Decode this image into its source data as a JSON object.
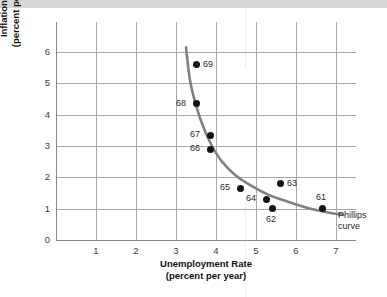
{
  "chart_data": {
    "type": "scatter",
    "title": "",
    "xlabel": "Unemployment Rate (percent per year)",
    "xlabel_line1": "Unemployment Rate",
    "xlabel_line2": "(percent per year)",
    "ylabel": "Inflation Rate (percent per year)",
    "ylabel_line1": "Inflation Rate",
    "ylabel_line2": "(percent per year)",
    "xlim": [
      0,
      7.5
    ],
    "ylim": [
      0,
      6.4
    ],
    "xticks": [
      "1",
      "2",
      "3",
      "4",
      "5",
      "6",
      "7"
    ],
    "yticks": [
      "0",
      "1",
      "2",
      "3",
      "4",
      "5",
      "6"
    ],
    "grid": "both",
    "legend": "none",
    "annotations": [
      {
        "name": "phillips-curve-label",
        "line1": "Phillips",
        "line2": "curve",
        "x": 7.05,
        "y": 0.78
      }
    ],
    "points": [
      {
        "label": "69",
        "x": 3.5,
        "y": 5.6,
        "label_pos": "right"
      },
      {
        "label": "68",
        "x": 3.5,
        "y": 4.35,
        "label_pos": "left"
      },
      {
        "label": "67",
        "x": 3.85,
        "y": 3.35,
        "label_pos": "left"
      },
      {
        "label": "66",
        "x": 3.85,
        "y": 2.9,
        "label_pos": "left"
      },
      {
        "label": "65",
        "x": 4.6,
        "y": 1.65,
        "label_pos": "left"
      },
      {
        "label": "64",
        "x": 5.25,
        "y": 1.3,
        "label_pos": "left"
      },
      {
        "label": "63",
        "x": 5.6,
        "y": 1.8,
        "label_pos": "right"
      },
      {
        "label": "62",
        "x": 5.4,
        "y": 1.0,
        "label_pos": "below"
      },
      {
        "label": "61",
        "x": 6.65,
        "y": 1.0,
        "label_pos": "above"
      }
    ],
    "curve": {
      "name": "Phillips curve",
      "color": "#808080",
      "points": [
        {
          "x": 3.25,
          "y": 6.15
        },
        {
          "x": 3.35,
          "y": 5.1
        },
        {
          "x": 3.5,
          "y": 4.3
        },
        {
          "x": 3.7,
          "y": 3.55
        },
        {
          "x": 3.9,
          "y": 3.0
        },
        {
          "x": 4.15,
          "y": 2.5
        },
        {
          "x": 4.5,
          "y": 2.05
        },
        {
          "x": 4.9,
          "y": 1.72
        },
        {
          "x": 5.3,
          "y": 1.45
        },
        {
          "x": 5.8,
          "y": 1.22
        },
        {
          "x": 6.3,
          "y": 1.02
        },
        {
          "x": 6.8,
          "y": 0.88
        },
        {
          "x": 7.18,
          "y": 0.8
        }
      ]
    },
    "colors": {
      "point": "#141414",
      "curve": "#808080",
      "grid": "#a8a8a8",
      "axis": "#8a8a8a",
      "text": "#111111"
    }
  }
}
